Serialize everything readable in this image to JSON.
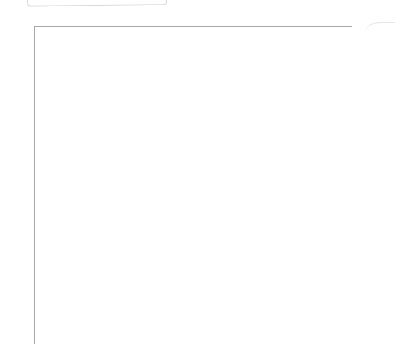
{
  "chart_data": {
    "type": "heatmap",
    "title": "",
    "columns": 13,
    "rows": 17,
    "row_labels_left": [
      "16",
      "14",
      "12",
      "10",
      "8",
      "6",
      "4",
      "2"
    ],
    "row_labels_right": [
      "17",
      "15",
      "13",
      "11",
      "9",
      "7",
      "5",
      "3",
      "1"
    ],
    "colors": {
      "filled": "#b6b6b6",
      "empty": "#ffffff",
      "grid_line": "#a8a8a8"
    },
    "grid": [
      {
        "row": 17,
        "cells": [
          0,
          1,
          1,
          0,
          0,
          0,
          0,
          0,
          0,
          0,
          1,
          1,
          0
        ]
      },
      {
        "row": 16,
        "cells": [
          1,
          1,
          1,
          1,
          0,
          0,
          0,
          0,
          0,
          1,
          1,
          1,
          1
        ]
      },
      {
        "row": 15,
        "cells": [
          1,
          1,
          1,
          1,
          1,
          0,
          0,
          0,
          1,
          1,
          1,
          1,
          1
        ]
      },
      {
        "row": 14,
        "cells": [
          1,
          1,
          1,
          1,
          1,
          1,
          0,
          1,
          1,
          1,
          1,
          1,
          1
        ]
      },
      {
        "row": 13,
        "cells": [
          1,
          1,
          1,
          1,
          1,
          1,
          1,
          1,
          1,
          1,
          1,
          1,
          1
        ]
      },
      {
        "row": 12,
        "cells": [
          1,
          1,
          1,
          1,
          1,
          1,
          1,
          1,
          1,
          1,
          1,
          1,
          1
        ]
      },
      {
        "row": 11,
        "cells": [
          1,
          1,
          1,
          1,
          1,
          1,
          1,
          1,
          1,
          1,
          1,
          1,
          1
        ]
      },
      {
        "row": 10,
        "cells": [
          0,
          1,
          1,
          1,
          1,
          1,
          1,
          1,
          1,
          1,
          1,
          1,
          0
        ]
      },
      {
        "row": 9,
        "cells": [
          0,
          1,
          1,
          1,
          1,
          1,
          1,
          1,
          1,
          1,
          1,
          1,
          0
        ]
      },
      {
        "row": 8,
        "cells": [
          0,
          0,
          1,
          1,
          1,
          1,
          1,
          1,
          1,
          1,
          1,
          0,
          0
        ]
      },
      {
        "row": 7,
        "cells": [
          0,
          0,
          1,
          1,
          1,
          1,
          1,
          1,
          1,
          1,
          1,
          0,
          0
        ]
      },
      {
        "row": 6,
        "cells": [
          0,
          0,
          0,
          1,
          1,
          1,
          1,
          1,
          1,
          1,
          0,
          0,
          0
        ]
      },
      {
        "row": 5,
        "cells": [
          0,
          0,
          0,
          1,
          1,
          1,
          1,
          1,
          1,
          1,
          0,
          0,
          0
        ]
      },
      {
        "row": 4,
        "cells": [
          0,
          0,
          0,
          0,
          1,
          1,
          1,
          1,
          1,
          0,
          0,
          0,
          0
        ]
      },
      {
        "row": 3,
        "cells": [
          0,
          0,
          0,
          0,
          1,
          1,
          1,
          1,
          1,
          0,
          0,
          0,
          0
        ]
      },
      {
        "row": 2,
        "cells": [
          0,
          0,
          0,
          0,
          0,
          1,
          1,
          1,
          0,
          0,
          0,
          0,
          0
        ]
      },
      {
        "row": 1,
        "cells": [
          0,
          0,
          0,
          0,
          0,
          0,
          1,
          0,
          0,
          0,
          0,
          0,
          0
        ]
      }
    ]
  }
}
